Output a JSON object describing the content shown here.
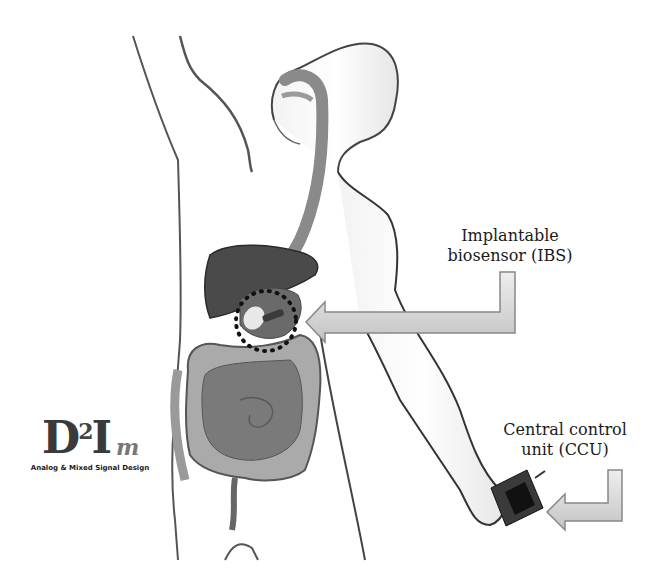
{
  "figure": {
    "labels": {
      "ibs_line1": "Implantable",
      "ibs_line2": "biosensor (IBS)",
      "ccu_line1": "Central control",
      "ccu_line2": "unit (CCU)"
    },
    "logo": {
      "main": "D",
      "superscript": "2",
      "letter_i": "I",
      "letter_m": "m",
      "tagline": "Analog & Mixed Signal Design"
    },
    "colors": {
      "outline": "#3a3a3a",
      "liver": "#4a4a4a",
      "intestine": "#7a7a7a",
      "colon": "#a8a8a8",
      "esophagus": "#8a8a8a",
      "arrow_fill": "#d8d8d8",
      "arrow_stroke": "#888888",
      "device": "#2a2a2a"
    }
  }
}
